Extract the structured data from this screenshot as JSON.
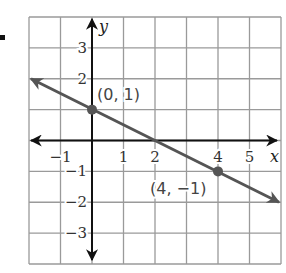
{
  "chart_data": {
    "type": "line",
    "title": "",
    "xlabel": "x",
    "ylabel": "y",
    "xlim": [
      -2,
      6
    ],
    "ylim": [
      -4,
      4
    ],
    "grid": true,
    "x_tick_labels": [
      "−1",
      "1",
      "2",
      "4",
      "5"
    ],
    "x_tick_values": [
      -1,
      1,
      2,
      4,
      5
    ],
    "y_tick_labels": [
      "3",
      "2",
      "−1",
      "−2",
      "−3"
    ],
    "y_tick_values": [
      3,
      2,
      -1,
      -2,
      -3
    ],
    "series": [
      {
        "name": "line",
        "equation": "y = -1/2 x + 1",
        "x": [
          -2,
          0,
          2,
          4,
          6
        ],
        "y": [
          2,
          1,
          0,
          -1,
          -2
        ],
        "arrows": "both"
      }
    ],
    "points": [
      {
        "x": 0,
        "y": 1,
        "label": "(0, 1)"
      },
      {
        "x": 4,
        "y": -1,
        "label": "(4, −1)"
      }
    ],
    "colors": {
      "grid": "#9a9a9a",
      "axes": "#111111",
      "line": "#555555",
      "points": "#555555"
    }
  }
}
